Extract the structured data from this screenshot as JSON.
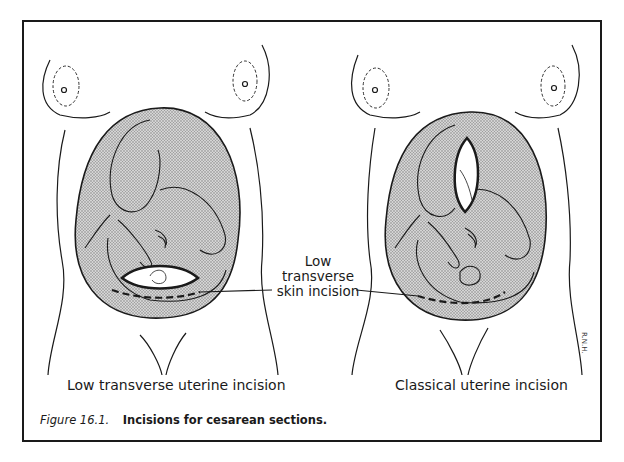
{
  "figure": {
    "number_label": "Figure 16.1.",
    "caption": "Incisions for cesarean sections."
  },
  "panels": [
    {
      "id": "left",
      "subtitle": "Low transverse uterine incision",
      "uterine_incision": "low-transverse",
      "skin_incision": "low-transverse"
    },
    {
      "id": "right",
      "subtitle": "Classical uterine incision",
      "uterine_incision": "classical-vertical",
      "skin_incision": "low-transverse"
    }
  ],
  "callout": {
    "line1": "Low",
    "line2": "transverse",
    "line3": "skin incision"
  },
  "artist_signature": "R.N.H.",
  "colors": {
    "line": "#1a1a1a",
    "uterus_fill": "#b8b8b8",
    "background": "#ffffff"
  }
}
